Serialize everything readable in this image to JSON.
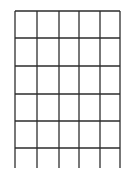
{
  "diagram": {
    "type": "grid",
    "columns": 5,
    "rows": 6,
    "vertical_lines_x": [
      15,
      37,
      59,
      79,
      100,
      120
    ],
    "horizontal_lines_y": [
      11,
      38,
      66,
      94,
      121,
      148
    ],
    "vertical_line_bottom_y": 168,
    "colors": {
      "background": "#ffffff",
      "horizontal_line": "#2b2b2b",
      "vertical_line": "#4a4a4a"
    },
    "stroke_width": {
      "horizontal": 1.5,
      "vertical": 1.5
    }
  }
}
